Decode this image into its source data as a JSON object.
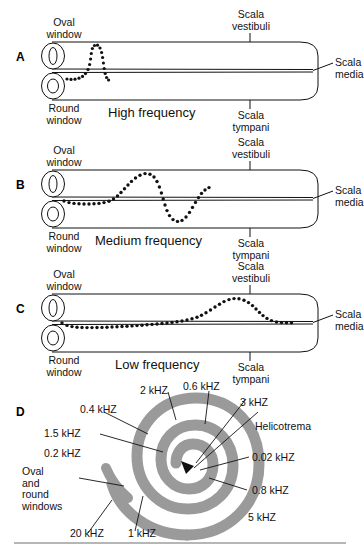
{
  "figure": {
    "ink_color": "#111111",
    "spiral_color": "#9a9a9a",
    "background": "#ffffff"
  },
  "panels": [
    {
      "letter": "A",
      "caption": "High frequency",
      "labels": {
        "oval_window": "Oval\nwindow",
        "oval_window_line1": "Oval",
        "oval_window_line2": "window",
        "round_window_line1": "Round",
        "round_window_line2": "window",
        "scala_vestibuli_line1": "Scala",
        "scala_vestibuli_line2": "vestibuli",
        "scala_tympani_line1": "Scala",
        "scala_tympani_line2": "tympani",
        "scala_media_line1": "Scala",
        "scala_media_line2": "media"
      }
    },
    {
      "letter": "B",
      "caption": "Medium frequency",
      "labels": {
        "oval_window_line1": "Oval",
        "oval_window_line2": "window",
        "round_window_line1": "Round",
        "round_window_line2": "window",
        "scala_vestibuli_line1": "Scala",
        "scala_vestibuli_line2": "vestibuli",
        "scala_tympani_line1": "Scala",
        "scala_tympani_line2": "tympani",
        "scala_media_line1": "Scala",
        "scala_media_line2": "media"
      }
    },
    {
      "letter": "C",
      "caption": "Low frequency",
      "labels": {
        "oval_window_line1": "Oval",
        "oval_window_line2": "window",
        "round_window_line1": "Round",
        "round_window_line2": "window",
        "scala_vestibuli_line1": "Scala",
        "scala_vestibuli_line2": "vestibuli",
        "scala_tympani_line1": "Scala",
        "scala_tympani_line2": "tympani",
        "scala_media_line1": "Scala",
        "scala_media_line2": "media"
      }
    }
  ],
  "spiral_panel": {
    "letter": "D",
    "labels": {
      "helicotrema": "Helicotrema",
      "windows_line1": "Oval",
      "windows_line2": "and",
      "windows_line3": "round",
      "windows_line4": "windows"
    },
    "frequency_labels": [
      {
        "text": "2 kHZ",
        "position": "top-left-inner"
      },
      {
        "text": "0.6 kHZ",
        "position": "top-center"
      },
      {
        "text": "3 kHZ",
        "position": "top-right"
      },
      {
        "text": "0.4 kHZ",
        "position": "upper-left"
      },
      {
        "text": "1.5 kHZ",
        "position": "left-upper"
      },
      {
        "text": "0.2 kHZ",
        "position": "left-middle"
      },
      {
        "text": "0.02 kHZ",
        "position": "right-middle"
      },
      {
        "text": "0.8 kHZ",
        "position": "right-lower"
      },
      {
        "text": "5 kHZ",
        "position": "lower-right"
      },
      {
        "text": "20 kHZ",
        "position": "bottom-left"
      },
      {
        "text": "1 kHZ",
        "position": "bottom-center"
      }
    ]
  }
}
